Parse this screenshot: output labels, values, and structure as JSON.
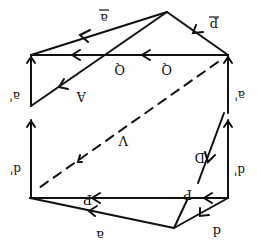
{
  "diagram": {
    "orientation": "rotated-180",
    "stroke_color": "#111111",
    "background": "#fefefe",
    "labels": {
      "a_bar": "a",
      "p_bar": "p",
      "Q_left": "Q",
      "Q_right": "Q",
      "A": "A",
      "a_prime_left": "a'",
      "a_prime_right": "a'",
      "V": "V",
      "D": "D",
      "d_prime_left": "d'",
      "d_prime_right": "d'",
      "P_left": "P",
      "P_right": "P",
      "a_bottom": "a",
      "d_bottom": "d"
    },
    "vectors": [
      {
        "name": "a-bar",
        "from": [
          167,
          12
        ],
        "to": [
          31,
          55
        ],
        "style": "solid"
      },
      {
        "name": "p-bar",
        "from": [
          228,
          55
        ],
        "to": [
          167,
          12
        ],
        "style": "solid"
      },
      {
        "name": "Q",
        "from": [
          228,
          55
        ],
        "to": [
          31,
          55
        ],
        "style": "solid"
      },
      {
        "name": "A",
        "from": [
          167,
          12
        ],
        "to": [
          31,
          106
        ],
        "style": "solid"
      },
      {
        "name": "a-prime-left",
        "from": [
          31,
          106
        ],
        "to": [
          31,
          55
        ],
        "style": "solid"
      },
      {
        "name": "d-prime-left",
        "from": [
          31,
          198
        ],
        "to": [
          31,
          120
        ],
        "style": "solid"
      },
      {
        "name": "a-prime-right",
        "from": [
          228,
          113
        ],
        "to": [
          228,
          55
        ],
        "style": "solid"
      },
      {
        "name": "d-prime-right",
        "from": [
          228,
          198
        ],
        "to": [
          228,
          120
        ],
        "style": "solid"
      },
      {
        "name": "V",
        "from": [
          218,
          62
        ],
        "to": [
          36,
          190
        ],
        "style": "dashed"
      },
      {
        "name": "D",
        "from": [
          224,
          113
        ],
        "to": [
          198,
          183
        ],
        "style": "solid"
      },
      {
        "name": "P",
        "from": [
          228,
          198
        ],
        "to": [
          30,
          198
        ],
        "style": "solid"
      },
      {
        "name": "a-bottom",
        "from": [
          174,
          228
        ],
        "to": [
          30,
          198
        ],
        "style": "solid"
      },
      {
        "name": "d-bottom",
        "from": [
          228,
          198
        ],
        "to": [
          174,
          228
        ],
        "style": "solid"
      },
      {
        "name": "link-bottom",
        "from": [
          174,
          228
        ],
        "to": [
          188,
          198
        ],
        "style": "solid"
      }
    ]
  }
}
